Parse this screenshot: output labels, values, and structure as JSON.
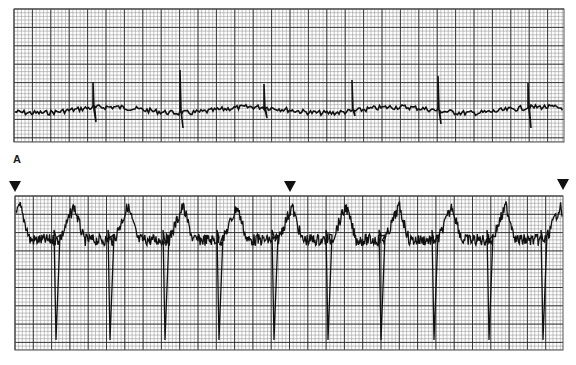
{
  "figure": {
    "panel_label": "A",
    "colors": {
      "trace": "#111111",
      "grid_minor": "#9a9a9a",
      "grid_major": "#2a2a2a",
      "paper": "#ffffff"
    }
  },
  "top_strip": {
    "box": {
      "x": 14,
      "y": 9,
      "w": 550,
      "h": 133
    },
    "major_spacing": 18.4,
    "minor_divisions": 5,
    "baseline_y": 110,
    "spikes": [
      {
        "x": 93,
        "up": 82,
        "down": 122
      },
      {
        "x": 180,
        "up": 70,
        "down": 128
      },
      {
        "x": 264,
        "up": 84,
        "down": 118
      },
      {
        "x": 352,
        "up": 80,
        "down": 116
      },
      {
        "x": 438,
        "up": 76,
        "down": 124
      },
      {
        "x": 528,
        "up": 83,
        "down": 128
      }
    ]
  },
  "bottom_strip": {
    "box": {
      "x": 15,
      "y": 196,
      "w": 548,
      "h": 154
    },
    "major_spacing": 18.3,
    "minor_divisions": 5,
    "beats_x": [
      20,
      74,
      128,
      183,
      237,
      292,
      346,
      399,
      452,
      506,
      560
    ],
    "deep_s_x": [
      56,
      110,
      165,
      219,
      274,
      328,
      381,
      434,
      489,
      543
    ],
    "peak_y": 206,
    "trough_y": 340,
    "plateau_y": 240
  },
  "markers": [
    {
      "name": "marker-left",
      "x": 9,
      "y": 181
    },
    {
      "name": "marker-middle",
      "x": 284,
      "y": 181
    },
    {
      "name": "marker-right",
      "x": 557,
      "y": 179
    }
  ]
}
